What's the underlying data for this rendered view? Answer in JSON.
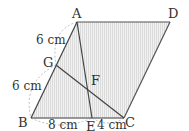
{
  "diagram": {
    "type": "geometry",
    "shape": "parallelogram ABCD",
    "points": {
      "A": {
        "label": "A",
        "x": 77,
        "y": 22
      },
      "D": {
        "label": "D",
        "x": 170,
        "y": 22
      },
      "B": {
        "label": "B",
        "x": 31,
        "y": 118
      },
      "C": {
        "label": "C",
        "x": 124,
        "y": 118
      },
      "E": {
        "label": "E",
        "x": 92,
        "y": 118
      },
      "G": {
        "label": "G",
        "x": 56,
        "y": 65
      },
      "F": {
        "label": "F",
        "x": 89,
        "y": 87
      }
    },
    "measurements": {
      "AG": "6 cm",
      "GB": "6 cm",
      "BE": "8 cm",
      "EC": "4 cm"
    },
    "colors": {
      "line": "#444444",
      "fill": "#e8e8e8",
      "hatch": "#d0d0d0",
      "dashed": "#999999"
    }
  }
}
